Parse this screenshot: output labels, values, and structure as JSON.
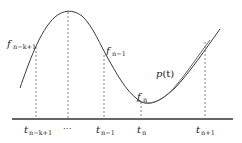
{
  "diagram": {
    "type": "interpolation-illustration",
    "colors": {
      "curve": "#3a3a3a",
      "polynomial": "#555555",
      "dashed": "#666666",
      "axis": "#333333",
      "text": "#222222"
    },
    "curves": {
      "function_f": {
        "label": ""
      },
      "polynomial": {
        "label": "p(t)",
        "label_main": "p",
        "label_arg": "(t)"
      }
    },
    "points": [
      {
        "id": "f_n_k_1",
        "label_main": "f",
        "label_sub": "n−k+1"
      },
      {
        "id": "f_n_1",
        "label_main": "f",
        "label_sub": "n−1"
      },
      {
        "id": "f_n",
        "label_main": "f",
        "label_sub": "n"
      }
    ],
    "axis_ticks": [
      {
        "label_main": "t",
        "label_sub": "n−k+1"
      },
      {
        "label": "···"
      },
      {
        "label_main": "t",
        "label_sub": "n−1"
      },
      {
        "label_main": "t",
        "label_sub": "n"
      },
      {
        "label_main": "t",
        "label_sub": "n+1"
      }
    ]
  }
}
